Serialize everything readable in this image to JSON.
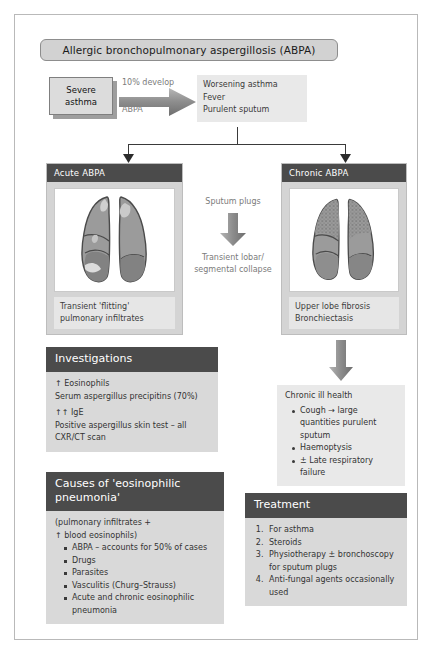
{
  "title": "Allergic bronchopulmonary aspergillosis (ABPA)",
  "flow": {
    "severe_asthma_line1": "Severe",
    "severe_asthma_line2": "asthma",
    "arrow_label_top": "10% develop",
    "arrow_label_bottom": "ABPA",
    "symptoms": [
      "Worsening asthma",
      "Fever",
      "Purulent sputum"
    ]
  },
  "acute_panel": {
    "heading": "Acute ABPA",
    "image_alt": "lungs-acute-abpa",
    "caption_line1": "Transient 'flitting'",
    "caption_line2": "pulmonary infiltrates"
  },
  "chronic_panel": {
    "heading": "Chronic ABPA",
    "image_alt": "lungs-chronic-abpa",
    "caption_line1": "Upper lobe fibrosis",
    "caption_line2": "Bronchiectasis"
  },
  "middle_flow": {
    "top_label": "Sputum plugs",
    "bottom_label_line1": "Transient lobar/",
    "bottom_label_line2": "segmental collapse"
  },
  "chronic_health": {
    "heading": "Chronic ill health",
    "items": [
      "Cough → large quantities purulent sputum",
      "Haemoptysis",
      "± Late respiratory failure"
    ]
  },
  "investigations": {
    "heading": "Investigations",
    "lines": [
      "↑ Eosinophils",
      "Serum aspergillus precipitins (70%)",
      "↑↑ IgE",
      "Positive aspergillus skin test – all",
      "CXR/CT scan"
    ]
  },
  "causes": {
    "heading_line1": "Causes of 'eosinophilic",
    "heading_line2": "pneumonia'",
    "subtitle_line1": "(pulmonary infiltrates +",
    "subtitle_line2": "↑ blood eosinophils)",
    "items": [
      "ABPA – accounts for 50% of cases",
      "Drugs",
      "Parasites",
      "Vasculitis (Churg–Strauss)",
      "Acute and chronic eosinophilic pneumonia"
    ]
  },
  "treatment": {
    "heading": "Treatment",
    "items": [
      "For asthma",
      "Steroids",
      "Physiotherapy ± bronchoscopy for sputum plugs",
      "Anti-fungal agents occasionally used"
    ]
  },
  "colors": {
    "header_bar": "#4b4b4b",
    "panel_bg": "#d4d4d4",
    "body_bg": "#d9d9d9",
    "accent_grey": "#9e9e9e",
    "lung_fill": "#9a9a9a",
    "frame_border": "#b9b9b9"
  }
}
